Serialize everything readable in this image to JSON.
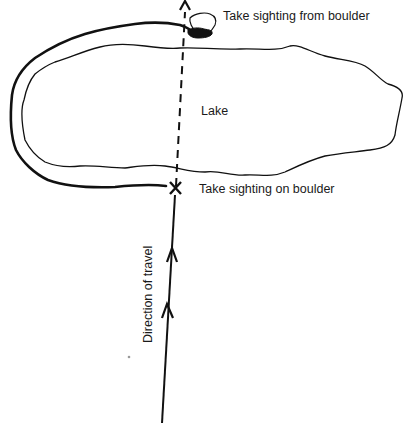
{
  "diagram": {
    "labels": {
      "sighting_from": "Take sighting from boulder",
      "lake": "Lake",
      "sighting_on": "Take sighting on boulder",
      "direction": "Direction of travel"
    },
    "colors": {
      "ink": "#111111",
      "background": "#ffffff",
      "speck": "#999999"
    }
  }
}
